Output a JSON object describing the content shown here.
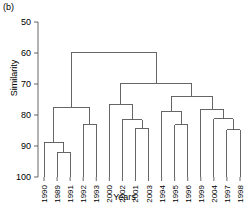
{
  "panel": {
    "label": "(b)"
  },
  "chart_data": {
    "type": "dendrogram",
    "title": "",
    "xlabel": "Years",
    "ylabel": "Similarity",
    "ylim": [
      50,
      100
    ],
    "y_inverted": true,
    "yticks": [
      50,
      60,
      70,
      80,
      90,
      100
    ],
    "ytick_labels": [
      "50",
      "60",
      "70",
      "80",
      "90",
      "100"
    ],
    "grid": false,
    "legend": null,
    "leaves": [
      "1990",
      "1989",
      "1991",
      "1992",
      "1993",
      "2000",
      "2002",
      "2001",
      "2003",
      "1994",
      "1995",
      "1996",
      "1999",
      "2004",
      "1997",
      "1998"
    ],
    "leaf_count": 16,
    "merges": [
      {
        "id": "m1",
        "children": [
          "1989",
          "1991"
        ],
        "similarity": 92.0
      },
      {
        "id": "m2",
        "children": [
          "1990",
          "m1"
        ],
        "similarity": 88.8
      },
      {
        "id": "m3",
        "children": [
          "1992",
          "1993"
        ],
        "similarity": 83.0
      },
      {
        "id": "m4",
        "children": [
          "m2",
          "m3"
        ],
        "similarity": 77.5
      },
      {
        "id": "m5",
        "children": [
          "2001",
          "2003"
        ],
        "similarity": 84.5
      },
      {
        "id": "m6",
        "children": [
          "2002",
          "m5"
        ],
        "similarity": 81.5
      },
      {
        "id": "m7",
        "children": [
          "2000",
          "m6"
        ],
        "similarity": 76.5
      },
      {
        "id": "m8",
        "children": [
          "1995",
          "1996"
        ],
        "similarity": 83.2
      },
      {
        "id": "m9",
        "children": [
          "1994",
          "m8"
        ],
        "similarity": 78.8
      },
      {
        "id": "m10",
        "children": [
          "1997",
          "1998"
        ],
        "similarity": 84.8
      },
      {
        "id": "m11",
        "children": [
          "2004",
          "m10"
        ],
        "similarity": 81.2
      },
      {
        "id": "m12",
        "children": [
          "1999",
          "m11"
        ],
        "similarity": 78.2
      },
      {
        "id": "m13",
        "children": [
          "m9",
          "m12"
        ],
        "similarity": 74.0
      },
      {
        "id": "m14",
        "children": [
          "m7",
          "m13"
        ],
        "similarity": 69.8
      },
      {
        "id": "m15",
        "children": [
          "m4",
          "m14"
        ],
        "similarity": 59.8
      }
    ],
    "line_color": "#555555",
    "axis_color": "#555555"
  }
}
